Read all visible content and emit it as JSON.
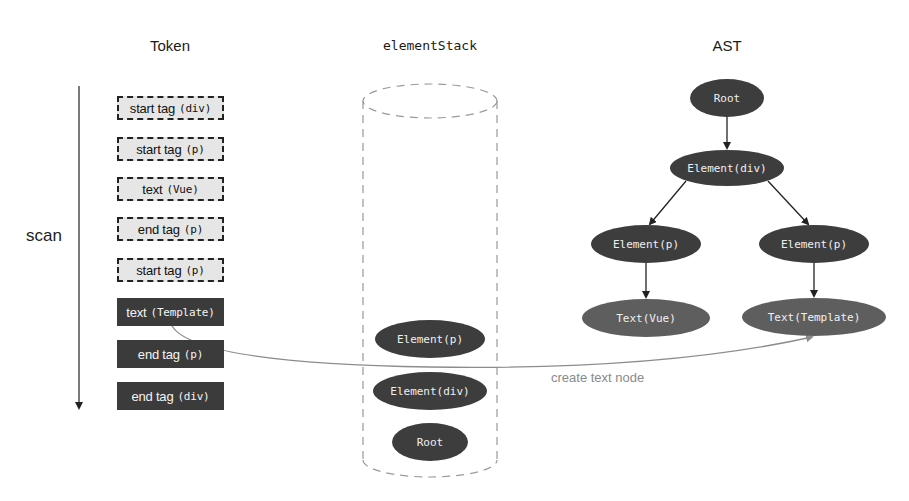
{
  "columns": {
    "token": {
      "title": "Token"
    },
    "stack": {
      "title": "elementStack"
    },
    "ast": {
      "title": "AST"
    }
  },
  "scan": {
    "label": "scan"
  },
  "tokens": [
    {
      "type": "start tag",
      "arg": "(div)",
      "state": "pending"
    },
    {
      "type": "start tag",
      "arg": "(p)",
      "state": "pending"
    },
    {
      "type": "text",
      "arg": "(Vue)",
      "state": "pending"
    },
    {
      "type": "end tag",
      "arg": "(p)",
      "state": "pending"
    },
    {
      "type": "start tag",
      "arg": "(p)",
      "state": "pending"
    },
    {
      "type": "text",
      "arg": "(Template)",
      "state": "current"
    },
    {
      "type": "end tag",
      "arg": "(p)",
      "state": "current"
    },
    {
      "type": "end tag",
      "arg": "(div)",
      "state": "current"
    }
  ],
  "stack": {
    "items_top_to_bottom": [
      "Element(p)",
      "Element(div)",
      "Root"
    ]
  },
  "ast": {
    "root": "Root",
    "div": "Element(div)",
    "p_left": "Element(p)",
    "p_right": "Element(p)",
    "text_left": "Text(Vue)",
    "text_right": "Text(Template)"
  },
  "annotation": {
    "label": "create text node"
  },
  "colors": {
    "element_node": "#3d3d3d",
    "text_node": "#5e5e5e",
    "pending_token_bg": "#e6e6e6",
    "done_token_bg": "#3b3b3b",
    "edge": "#222222",
    "connector": "#8c8c8c",
    "caption": "#8a8a8a"
  }
}
